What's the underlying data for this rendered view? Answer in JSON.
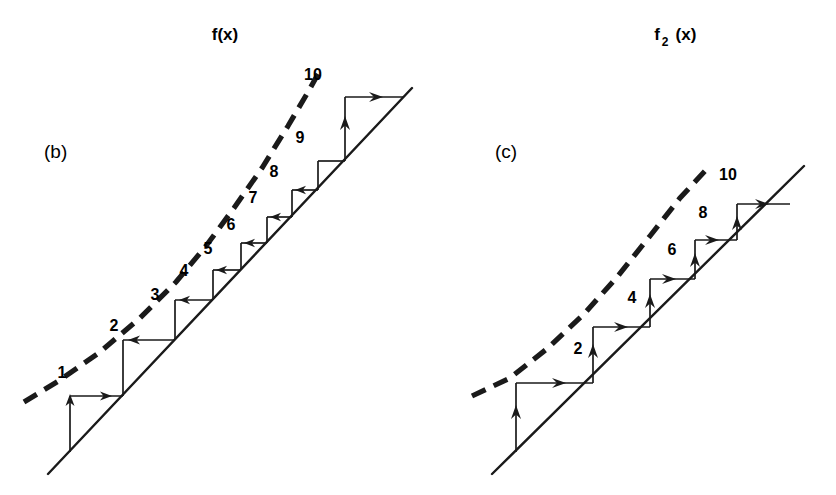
{
  "figure": {
    "background_color": "#ffffff",
    "ink_color": "#1a1a1a",
    "width": 836,
    "height": 495
  },
  "panels": [
    {
      "id": "panel-b",
      "caption": "(b)",
      "caption_pos": {
        "x": 44,
        "y": 158
      },
      "function_title": "f(x)",
      "function_title_base": "f(x)",
      "function_title_sub": "",
      "title_pos": {
        "x": 225,
        "y": 40
      },
      "identity_line": {
        "x1": 48,
        "y1": 474,
        "x2": 412,
        "y2": 88
      },
      "dashed_curve_label": "f(x)",
      "dashed_curve_points": "24,402 60,380 100,352 140,318 176,282 206,246 234,208 262,168 288,126 308,92 318,74",
      "step_labels": [
        "1",
        "2",
        "3",
        "4",
        "5",
        "6",
        "7",
        "8",
        "9",
        "10"
      ],
      "step_label_positions": [
        {
          "label": "1",
          "x": 62,
          "y": 378
        },
        {
          "label": "2",
          "x": 114,
          "y": 331
        },
        {
          "label": "3",
          "x": 155,
          "y": 300
        },
        {
          "label": "4",
          "x": 184,
          "y": 276
        },
        {
          "label": "5",
          "x": 208,
          "y": 254
        },
        {
          "label": "6",
          "x": 231,
          "y": 230
        },
        {
          "label": "7",
          "x": 253,
          "y": 203
        },
        {
          "label": "8",
          "x": 274,
          "y": 177
        },
        {
          "label": "9",
          "x": 300,
          "y": 143
        },
        {
          "label": "10",
          "x": 313,
          "y": 80
        }
      ],
      "cobweb_vertices": [
        {
          "x": 70,
          "y": 452
        },
        {
          "x": 70,
          "y": 396
        },
        {
          "x": 123,
          "y": 396
        },
        {
          "x": 123,
          "y": 340
        },
        {
          "x": 175,
          "y": 340
        },
        {
          "x": 175,
          "y": 300
        },
        {
          "x": 213,
          "y": 300
        },
        {
          "x": 213,
          "y": 270
        },
        {
          "x": 241,
          "y": 270
        },
        {
          "x": 241,
          "y": 243
        },
        {
          "x": 267,
          "y": 243
        },
        {
          "x": 267,
          "y": 217
        },
        {
          "x": 292,
          "y": 217
        },
        {
          "x": 292,
          "y": 190
        },
        {
          "x": 318,
          "y": 190
        },
        {
          "x": 318,
          "y": 161
        },
        {
          "x": 345,
          "y": 161
        },
        {
          "x": 345,
          "y": 97
        },
        {
          "x": 403,
          "y": 97
        }
      ]
    },
    {
      "id": "panel-c",
      "caption": "(c)",
      "caption_pos": {
        "x": 495,
        "y": 158
      },
      "function_title": "f2(x)",
      "function_title_base_left": "f",
      "function_title_sub": "2",
      "function_title_base_right": "(x)",
      "title_pos": {
        "x": 672,
        "y": 40
      },
      "identity_line": {
        "x1": 492,
        "y1": 474,
        "x2": 804,
        "y2": 166
      },
      "dashed_curve_points": "472,396 510,378 548,348 584,314 618,276 650,236 680,198 706,170",
      "step_labels": [
        "2",
        "4",
        "6",
        "8",
        "10"
      ],
      "step_label_positions": [
        {
          "label": "2",
          "x": 578,
          "y": 354
        },
        {
          "label": "4",
          "x": 632,
          "y": 303
        },
        {
          "label": "6",
          "x": 672,
          "y": 255
        },
        {
          "label": "8",
          "x": 703,
          "y": 218
        },
        {
          "label": "10",
          "x": 728,
          "y": 180
        }
      ],
      "cobweb_vertices": [
        {
          "x": 516,
          "y": 452
        },
        {
          "x": 516,
          "y": 383
        },
        {
          "x": 593,
          "y": 383
        },
        {
          "x": 593,
          "y": 327
        },
        {
          "x": 650,
          "y": 327
        },
        {
          "x": 650,
          "y": 279
        },
        {
          "x": 695,
          "y": 279
        },
        {
          "x": 695,
          "y": 240
        },
        {
          "x": 737,
          "y": 240
        },
        {
          "x": 737,
          "y": 204
        },
        {
          "x": 790,
          "y": 204
        }
      ]
    }
  ]
}
